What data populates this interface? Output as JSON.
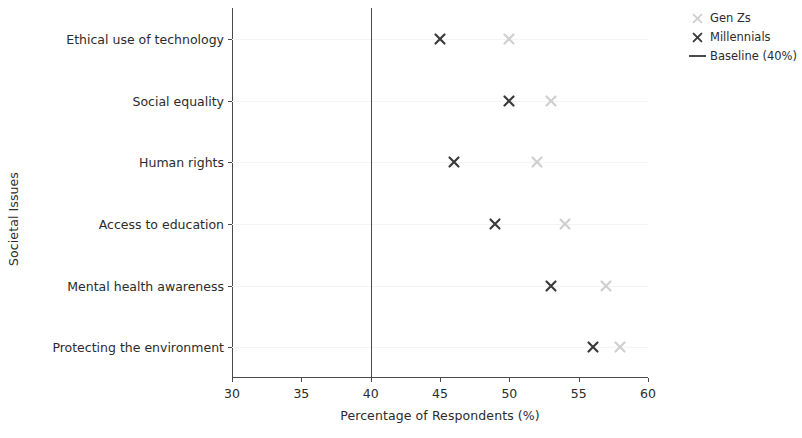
{
  "chart_data": {
    "type": "scatter",
    "title": "",
    "xlabel": "Percentage of Respondents (%)",
    "ylabel": "Societal Issues",
    "categories": [
      "Ethical use of technology",
      "Social equality",
      "Human rights",
      "Access to education",
      "Mental health awareness",
      "Protecting the environment"
    ],
    "series": [
      {
        "name": "Gen Zs",
        "marker": "x",
        "color": "#cfcfcf",
        "values": [
          50,
          53,
          52,
          54,
          57,
          58
        ]
      },
      {
        "name": "Millennials",
        "marker": "x",
        "color": "#3a3a3a",
        "values": [
          45,
          50,
          46,
          49,
          53,
          56
        ]
      }
    ],
    "reference_lines": [
      {
        "name": "Baseline (40%)",
        "orientation": "vertical",
        "value": 40,
        "color": "#4a4a4a"
      }
    ],
    "xlim": [
      30,
      60
    ],
    "xticks": [
      30,
      35,
      40,
      45,
      50,
      55,
      60
    ],
    "xtick_labels": [
      "30",
      "35",
      "40",
      "45",
      "50",
      "55",
      "60"
    ],
    "grid": false,
    "legend_position": "upper right",
    "legend_entries": [
      "Gen Zs",
      "Millennials",
      "Baseline (40%)"
    ]
  },
  "axes": {
    "x_title": "Percentage of Respondents (%)",
    "y_title": "Societal Issues"
  },
  "legend": {
    "items": [
      {
        "label": "Gen Zs",
        "kind": "marker",
        "color": "#cfcfcf"
      },
      {
        "label": "Millennials",
        "kind": "marker",
        "color": "#3a3a3a"
      },
      {
        "label": "Baseline (40%)",
        "kind": "line",
        "color": "#4a4a4a"
      }
    ]
  },
  "colors": {
    "gen_zs": "#cfcfcf",
    "millennials": "#3a3a3a",
    "baseline": "#4a4a4a",
    "axis": "#4a4a4a",
    "text": "#2b2b2b",
    "background": "#ffffff"
  }
}
